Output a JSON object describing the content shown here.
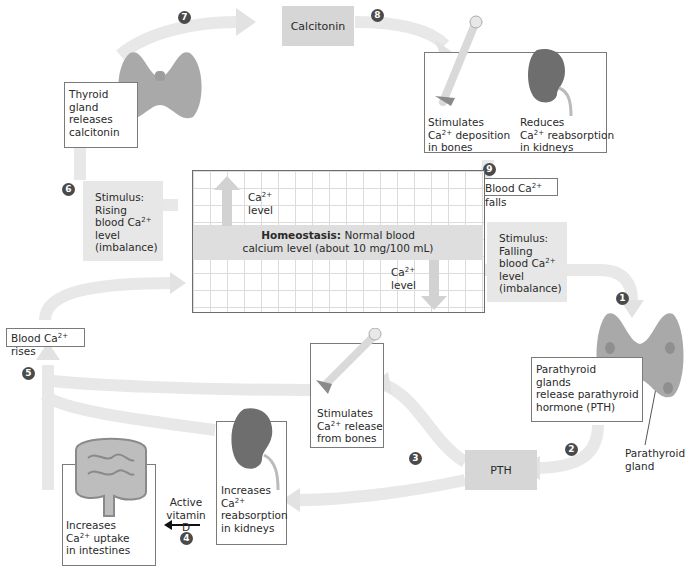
{
  "diagram": {
    "homeostasis": {
      "bold": "Homeostasis:",
      "line1_rest": " Normal blood",
      "line2": "calcium level (about 10 mg/100 mL)",
      "up_label_ion": "Ca",
      "up_label_sup": "2+",
      "up_label_word": "level",
      "down_label_ion": "Ca",
      "down_label_sup": "2+",
      "down_label_word": "level"
    },
    "steps": [
      "1",
      "2",
      "3",
      "4",
      "5",
      "6",
      "7",
      "8",
      "9"
    ],
    "rising_branch": {
      "stimulus": {
        "l1": "Stimulus:",
        "l2": "Rising",
        "l3a": "blood Ca",
        "l3sup": "2+",
        "l4": "level",
        "l5": "(imbalance)"
      },
      "thyroid": {
        "l1": "Thyroid",
        "l2": "gland",
        "l3": "releases",
        "l4": "calcitonin"
      },
      "hormone": "Calcitonin",
      "effects": {
        "bones": {
          "l1": "Stimulates",
          "l2a": "Ca",
          "l2sup": "2+",
          "l2b": " deposition",
          "l3": "in bones"
        },
        "kidneys": {
          "l1": "Reduces",
          "l2a": "Ca",
          "l2sup": "2+",
          "l2b": " reabsorption",
          "l3": "in kidneys"
        }
      },
      "result": {
        "a": "Blood Ca",
        "sup": "2+",
        "b": " falls"
      }
    },
    "falling_branch": {
      "stimulus": {
        "l1": "Stimulus:",
        "l2": "Falling",
        "l3a": "blood Ca",
        "l3sup": "2+",
        "l4": "level",
        "l5": "(imbalance)"
      },
      "parathyroid": {
        "l1": "Parathyroid",
        "l2": "glands",
        "l3": "release parathyroid",
        "l4": "hormone (PTH)"
      },
      "parathyroid_callout": {
        "l1": "Parathyroid",
        "l2": "gland"
      },
      "hormone": "PTH",
      "effects": {
        "bones": {
          "l1": "Stimulates",
          "l2a": "Ca",
          "l2sup": "2+",
          "l2b": " release",
          "l3": "from bones"
        },
        "kidneys": {
          "l1": "Increases",
          "l2a": "Ca",
          "l2sup": "2+",
          "l3": "reabsorption",
          "l4": "in kidneys"
        },
        "intestines": {
          "l1": "Increases",
          "l2a": "Ca",
          "l2sup": "2+",
          "l2b": " uptake",
          "l3": "in intestines"
        }
      },
      "vitamin_d": {
        "l1": "Active",
        "l2": "vitamin D"
      },
      "result": {
        "a": "Blood Ca",
        "sup": "2+",
        "b": " rises"
      }
    },
    "colors": {
      "arrow": "#e6e6e6",
      "hormone_box": "#d6d6d6",
      "stimulus_box": "#e7e7e7",
      "step_circle": "#4a4a4a",
      "organ": "#9a9a9a",
      "kidney": "#6a6a6a"
    }
  }
}
